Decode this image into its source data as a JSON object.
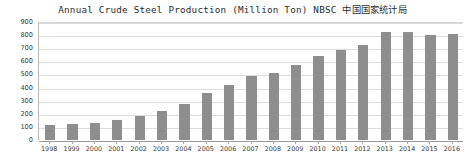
{
  "chart_data": {
    "type": "bar",
    "title": "Annual Crude Steel Production (Million Ton) NBSC 中国国家统计局",
    "xlabel": "",
    "ylabel": "",
    "categories": [
      "1998",
      "1999",
      "2000",
      "2001",
      "2002",
      "2003",
      "2004",
      "2005",
      "2006",
      "2007",
      "2008",
      "2009",
      "2010",
      "2011",
      "2012",
      "2013",
      "2014",
      "2015",
      "2016"
    ],
    "values": [
      115,
      124,
      129,
      151,
      182,
      222,
      273,
      356,
      421,
      490,
      512,
      574,
      639,
      685,
      724,
      822,
      823,
      804,
      808
    ],
    "series": [
      {
        "name": "Crude Steel Production",
        "values": [
          115,
          124,
          129,
          151,
          182,
          222,
          273,
          356,
          421,
          490,
          512,
          574,
          639,
          685,
          724,
          822,
          823,
          804,
          808
        ]
      }
    ],
    "ylim": [
      0,
      900
    ],
    "y_ticks": [
      0,
      100,
      200,
      300,
      400,
      500,
      600,
      700,
      800,
      900
    ],
    "y_tick_labels": [
      "0",
      "100",
      "200",
      "300",
      "400",
      "500",
      "600",
      "700",
      "800",
      "900"
    ],
    "grid": true,
    "legend": false,
    "legend_position": "none",
    "bar_color": "#8e8e8e",
    "gridline_color": "#dcdcdc",
    "axis_color": "#9a9a9a",
    "background_color": "#ffffff",
    "text_color": "#3a3a3a"
  }
}
